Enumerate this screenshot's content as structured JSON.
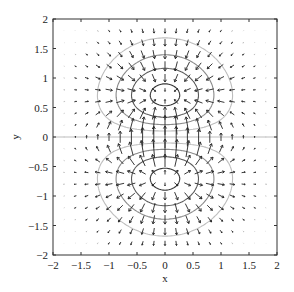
{
  "chart_data": {
    "type": "quiver+contour",
    "title": "",
    "xlabel": "x",
    "ylabel": "y",
    "xlim": [
      -2,
      2
    ],
    "ylim": [
      -2,
      2
    ],
    "xticks": [
      -2,
      -1.5,
      -1,
      -0.5,
      0,
      0.5,
      1,
      1.5,
      2
    ],
    "xtick_labels": [
      "−2",
      "−1.5",
      "−1",
      "−0.5",
      "0",
      "0.5",
      "1",
      "1.5",
      "2"
    ],
    "yticks": [
      -2,
      -1.5,
      -1,
      -0.5,
      0,
      0.5,
      1,
      1.5,
      2
    ],
    "ytick_labels": [
      "−2",
      "−1.5",
      "−1",
      "−0.5",
      "0",
      "0.5",
      "1",
      "1.5",
      "2"
    ],
    "field_function": "f(x,y) = y * exp(-x^2 - y^2); arrows = gradient of f",
    "quiver_grid": {
      "x_start": -2,
      "x_end": 2,
      "y_start": -2,
      "y_end": 2,
      "step": 0.2
    },
    "contour_levels": [
      {
        "level": 0.1,
        "color": "#bdbdbd"
      },
      {
        "level": 0.2,
        "color": "#8a8a8a"
      },
      {
        "level": 0.3,
        "color": "#5a5a5a"
      },
      {
        "level": 0.4,
        "color": "#333333"
      },
      {
        "level": -0.1,
        "color": "#bdbdbd"
      },
      {
        "level": -0.2,
        "color": "#8a8a8a"
      },
      {
        "level": -0.3,
        "color": "#5a5a5a"
      },
      {
        "level": -0.4,
        "color": "#333333"
      }
    ],
    "zero_line": {
      "y": 0,
      "color": "#bdbdbd"
    },
    "extrema": [
      {
        "type": "max",
        "x": 0,
        "y": 0.71
      },
      {
        "type": "min",
        "x": 0,
        "y": -0.71
      }
    ],
    "grid": false
  },
  "colors": {
    "axes": "#333333",
    "arrow": "#222222",
    "background": "#ffffff"
  }
}
